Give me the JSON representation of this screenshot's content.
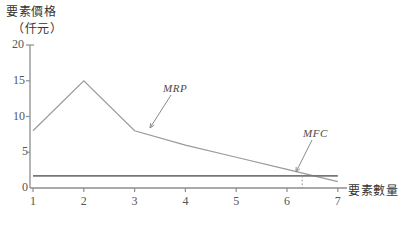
{
  "chart_data": {
    "type": "line",
    "title": "",
    "ylabel": "要素價格",
    "ylabel_unit": "（仟元）",
    "xlabel": "要素數量",
    "xlim": [
      0.6,
      7.3
    ],
    "ylim": [
      0,
      20
    ],
    "xticks": [
      1,
      2,
      3,
      4,
      5,
      6,
      7
    ],
    "xtick_labels": [
      "1",
      "2",
      "3",
      "4",
      "5",
      "6",
      "7"
    ],
    "yticks": [
      0,
      5,
      10,
      15,
      20
    ],
    "ytick_labels": [
      "0",
      "5",
      "10",
      "15",
      "20"
    ],
    "grid": false,
    "legend_position": "inline-annotation",
    "x": [
      1,
      2,
      3,
      4,
      5,
      6,
      7
    ],
    "series": [
      {
        "name": "MRP",
        "label": "MRP",
        "values": [
          8,
          15,
          8,
          6,
          4.3,
          2.6,
          0.9
        ],
        "color": "#9a9a9a"
      },
      {
        "name": "MFC",
        "label": "MFC",
        "values": [
          1.7,
          1.7,
          1.7,
          1.7,
          1.7,
          1.7,
          1.7
        ],
        "color": "#777777"
      }
    ],
    "annotations": [
      {
        "name": "mrp-annotation",
        "text": "MRP",
        "points_to_x": 3,
        "points_to_y": 8
      },
      {
        "name": "mfc-annotation",
        "text": "MFC",
        "points_to_x": 6.55,
        "points_to_y": 1.7
      }
    ],
    "intersection": {
      "x": 6.3,
      "y": 1.7,
      "guide": "dotted-vertical"
    }
  },
  "axes": {
    "y_title_line1": "要素價格",
    "y_title_line2": "（仟元）",
    "x_title": "要素數量"
  }
}
